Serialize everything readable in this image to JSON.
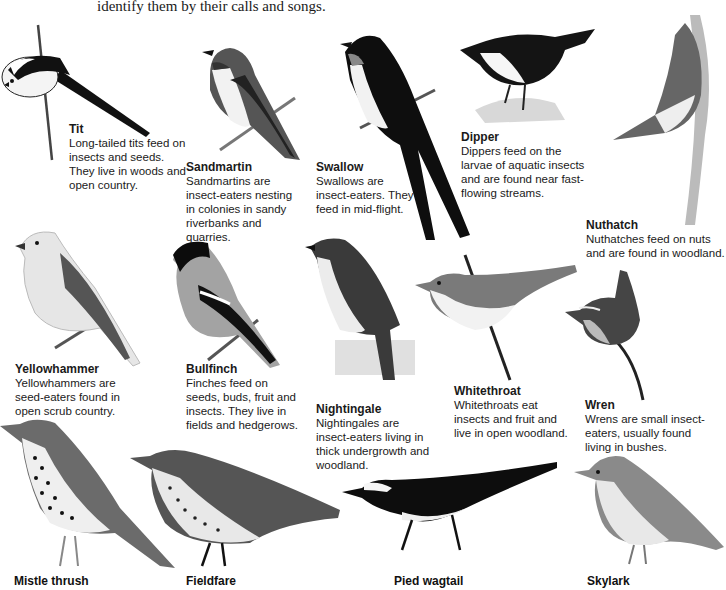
{
  "intro_text": "identify them by their calls and songs.",
  "birds": [
    {
      "name": "Tit",
      "description": "Long-tailed tits feed on insects and seeds. They live in woods and open country."
    },
    {
      "name": "Sandmartin",
      "description": "Sandmartins are insect-eaters nesting in colonies in sandy riverbanks and quarries."
    },
    {
      "name": "Swallow",
      "description": "Swallows are insect-eaters. They feed in mid-flight."
    },
    {
      "name": "Dipper",
      "description": "Dippers feed on the larvae of aquatic insects and are found near fast-flowing streams."
    },
    {
      "name": "Nuthatch",
      "description": "Nuthatches feed on nuts and are found in woodland."
    },
    {
      "name": "Yellowhammer",
      "description": "Yellowhammers are seed-eaters found in open scrub country."
    },
    {
      "name": "Bullfinch",
      "description": "Finches feed on seeds, buds, fruit and insects. They live in fields and hedgerows."
    },
    {
      "name": "Nightingale",
      "description": "Nightingales are insect-eaters living in thick undergrowth and woodland."
    },
    {
      "name": "Whitethroat",
      "description": "Whitethroats eat insects and fruit and live in open woodland."
    },
    {
      "name": "Wren",
      "description": "Wrens are small insect-eaters, usually found living in bushes."
    },
    {
      "name": "Mistle thrush",
      "description": ""
    },
    {
      "name": "Fieldfare",
      "description": ""
    },
    {
      "name": "Pied wagtail",
      "description": ""
    },
    {
      "name": "Skylark",
      "description": ""
    }
  ],
  "colors": {
    "text": "#1a1a1a",
    "background": "#ffffff"
  }
}
